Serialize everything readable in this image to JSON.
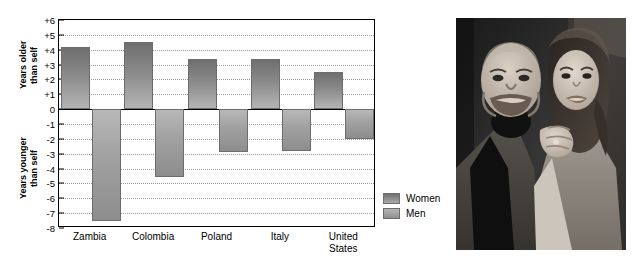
{
  "chart_data": {
    "type": "bar",
    "title": "",
    "xlabel": "",
    "ylabel_top": "Years older\nthan self",
    "ylabel_bottom": "Years younger\nthan self",
    "categories": [
      "Zambia",
      "Colombia",
      "Poland",
      "Italy",
      "United\nStates"
    ],
    "series": [
      {
        "name": "Women",
        "values": [
          4.2,
          4.5,
          3.4,
          3.4,
          2.5
        ]
      },
      {
        "name": "Men",
        "values": [
          -7.5,
          -4.6,
          -2.9,
          -2.8,
          -2.0
        ]
      }
    ],
    "ylim": [
      -8,
      6
    ],
    "yticks": [
      "+6",
      "+5",
      "+4",
      "+3",
      "+2",
      "+1",
      "0",
      "-1",
      "-2",
      "-3",
      "-4",
      "-5",
      "-6",
      "-7",
      "-8"
    ],
    "ytick_values": [
      6,
      5,
      4,
      3,
      2,
      1,
      0,
      -1,
      -2,
      -3,
      -4,
      -5,
      -6,
      -7,
      -8
    ],
    "grid": true,
    "legend_position": "right-bottom",
    "colors": {
      "women": "#8a8a8a",
      "men": "#a9a9a9",
      "axis": "#000000",
      "grid": "#9a9a9a"
    }
  },
  "legend": {
    "items": [
      {
        "label": "Women",
        "key": "women"
      },
      {
        "label": "Men",
        "key": "men"
      }
    ]
  },
  "photo": {
    "caption": "",
    "description": "black-and-white photograph of an older bald man in a suit beside a younger smiling woman with long dark hair"
  }
}
